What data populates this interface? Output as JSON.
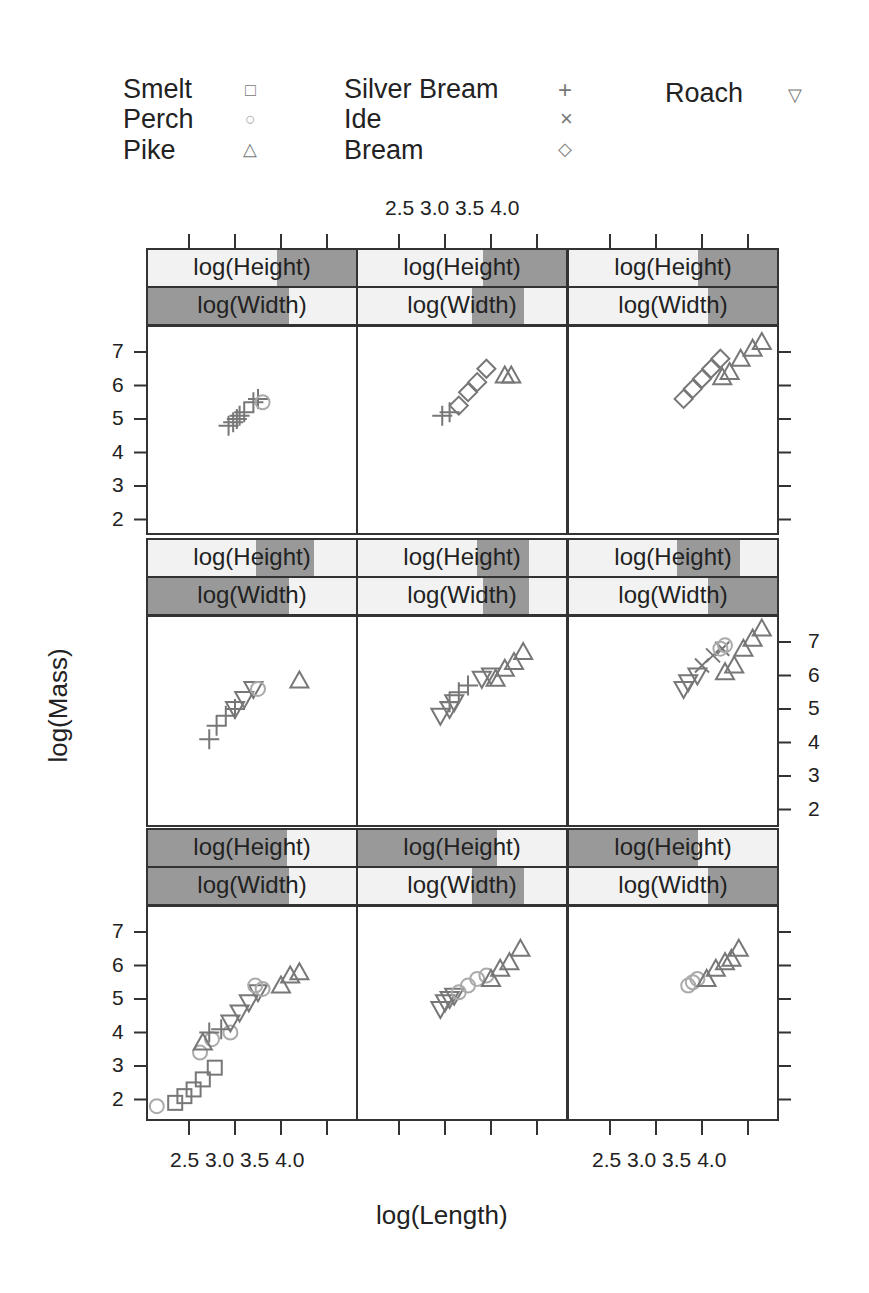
{
  "legend": {
    "items": [
      {
        "label": "Smelt",
        "symbol": "□",
        "shape": "square"
      },
      {
        "label": "Perch",
        "symbol": "○",
        "shape": "circle"
      },
      {
        "label": "Pike",
        "symbol": "△",
        "shape": "triangle"
      },
      {
        "label": "Silver Bream",
        "symbol": "+",
        "shape": "plus"
      },
      {
        "label": "Ide",
        "symbol": "×",
        "shape": "cross"
      },
      {
        "label": "Bream",
        "symbol": "◇",
        "shape": "diamond"
      },
      {
        "label": "Roach",
        "symbol": "▽",
        "shape": "triangle-down"
      }
    ]
  },
  "strips": {
    "height_label": "log(Height)",
    "width_label": "log(Width)"
  },
  "axes": {
    "x_ticks": [
      "2.5",
      "3.0",
      "3.5",
      "4.0"
    ],
    "y_ticks": [
      "2",
      "3",
      "4",
      "5",
      "6",
      "7"
    ],
    "xlabel": "log(Length)",
    "ylabel": "log(Mass)"
  },
  "colors": {
    "strip_shade": "#999999",
    "strip_bg": "#f2f2f2",
    "marker_dark": "#777777",
    "marker_light": "#aaaaaa",
    "frame": "#333333"
  },
  "chart_data": {
    "type": "scatter",
    "title": "",
    "xlabel": "log(Length)",
    "ylabel": "log(Mass)",
    "xlim": [
      2.0,
      4.3
    ],
    "ylim": [
      1.5,
      7.6
    ],
    "x_tick_labels": [
      "2.5",
      "3.0",
      "3.5",
      "4.0"
    ],
    "y_tick_labels": [
      "2",
      "3",
      "4",
      "5",
      "6",
      "7"
    ],
    "grid": false,
    "legend_position": "top",
    "layout": "3x3 coplot conditioned on log(Height) (upper strip) and log(Width) (lower strip)",
    "series_names": [
      "Smelt",
      "Perch",
      "Pike",
      "Silver Bream",
      "Ide",
      "Bream",
      "Roach"
    ],
    "panels": [
      {
        "row": 1,
        "col": 1,
        "height_shade": [
          0.62,
          1.0
        ],
        "width_shade": [
          0.0,
          0.68
        ],
        "points": [
          {
            "series": "Silver Bream",
            "x": [
              2.93,
              2.98,
              3.02,
              3.05,
              3.1,
              3.2,
              3.25
            ],
            "y": [
              4.8,
              4.9,
              5.0,
              5.1,
              5.2,
              5.5,
              5.6
            ]
          },
          {
            "series": "Perch",
            "x": [
              3.3
            ],
            "y": [
              5.5
            ]
          }
        ]
      },
      {
        "row": 1,
        "col": 2,
        "height_shade": [
          0.6,
          1.0
        ],
        "width_shade": [
          0.55,
          0.8
        ],
        "points": [
          {
            "series": "Silver Bream",
            "x": [
              2.97,
              3.05
            ],
            "y": [
              5.1,
              5.2
            ]
          },
          {
            "series": "Bream",
            "x": [
              3.15,
              3.25,
              3.35,
              3.45
            ],
            "y": [
              5.4,
              5.8,
              6.1,
              6.5
            ]
          },
          {
            "series": "Pike",
            "x": [
              3.65,
              3.72
            ],
            "y": [
              6.3,
              6.3
            ]
          }
        ]
      },
      {
        "row": 1,
        "col": 3,
        "height_shade": [
          0.62,
          1.0
        ],
        "width_shade": [
          0.67,
          1.0
        ],
        "points": [
          {
            "series": "Bream",
            "x": [
              3.3,
              3.4,
              3.5,
              3.6,
              3.7
            ],
            "y": [
              5.6,
              5.9,
              6.2,
              6.5,
              6.8
            ]
          },
          {
            "series": "Pike",
            "x": [
              3.72,
              3.8,
              3.92,
              4.05,
              4.15
            ],
            "y": [
              6.25,
              6.4,
              6.8,
              7.1,
              7.3
            ]
          }
        ]
      },
      {
        "row": 2,
        "col": 1,
        "height_shade": [
          0.52,
          0.8
        ],
        "width_shade": [
          0.0,
          0.68
        ],
        "points": [
          {
            "series": "Silver Bream",
            "x": [
              2.72,
              2.8,
              2.9,
              3.0
            ],
            "y": [
              4.1,
              4.5,
              4.8,
              5.0
            ]
          },
          {
            "series": "Roach",
            "x": [
              3.0,
              3.1,
              3.2
            ],
            "y": [
              5.0,
              5.3,
              5.6
            ]
          },
          {
            "series": "Perch",
            "x": [
              3.25
            ],
            "y": [
              5.6
            ]
          },
          {
            "series": "Pike",
            "x": [
              3.7
            ],
            "y": [
              5.85
            ]
          }
        ]
      },
      {
        "row": 2,
        "col": 2,
        "height_shade": [
          0.57,
          0.82
        ],
        "width_shade": [
          0.6,
          0.82
        ],
        "points": [
          {
            "series": "Roach",
            "x": [
              2.95,
              3.05,
              3.1
            ],
            "y": [
              4.8,
              5.0,
              5.2
            ]
          },
          {
            "series": "Silver Bream",
            "x": [
              3.05,
              3.15,
              3.25
            ],
            "y": [
              5.2,
              5.5,
              5.7
            ]
          },
          {
            "series": "Roach",
            "x": [
              3.4,
              3.5
            ],
            "y": [
              5.9,
              6.0
            ]
          },
          {
            "series": "Pike",
            "x": [
              3.55,
              3.65,
              3.75,
              3.85
            ],
            "y": [
              5.9,
              6.2,
              6.4,
              6.7
            ]
          }
        ]
      },
      {
        "row": 2,
        "col": 3,
        "height_shade": [
          0.52,
          0.82
        ],
        "width_shade": [
          0.67,
          1.0
        ],
        "points": [
          {
            "series": "Roach",
            "x": [
              3.3,
              3.35,
              3.45
            ],
            "y": [
              5.6,
              5.8,
              6.0
            ]
          },
          {
            "series": "Ide",
            "x": [
              3.5,
              3.62,
              3.72
            ],
            "y": [
              6.3,
              6.6,
              6.8
            ]
          },
          {
            "series": "Perch",
            "x": [
              3.7,
              3.75
            ],
            "y": [
              6.8,
              6.9
            ]
          },
          {
            "series": "Pike",
            "x": [
              3.75,
              3.85,
              3.95,
              4.05,
              4.15
            ],
            "y": [
              6.1,
              6.3,
              6.8,
              7.1,
              7.4
            ]
          }
        ]
      },
      {
        "row": 3,
        "col": 1,
        "height_shade": [
          0.0,
          0.67
        ],
        "width_shade": [
          0.0,
          0.68
        ],
        "points": [
          {
            "series": "Perch",
            "x": [
              2.15
            ],
            "y": [
              1.8
            ]
          },
          {
            "series": "Smelt",
            "x": [
              2.35,
              2.45,
              2.55,
              2.65,
              2.78
            ],
            "y": [
              1.9,
              2.1,
              2.3,
              2.6,
              2.95
            ]
          },
          {
            "series": "Perch",
            "x": [
              2.62,
              2.75,
              2.95
            ],
            "y": [
              3.4,
              3.8,
              4.0
            ]
          },
          {
            "series": "Pike",
            "x": [
              2.65
            ],
            "y": [
              3.7
            ]
          },
          {
            "series": "Silver Bream",
            "x": [
              2.72,
              2.85
            ],
            "y": [
              4.0,
              4.1
            ]
          },
          {
            "series": "Roach",
            "x": [
              2.95,
              3.05,
              3.15,
              3.25
            ],
            "y": [
              4.3,
              4.6,
              4.9,
              5.2
            ]
          },
          {
            "series": "Perch",
            "x": [
              3.22,
              3.3
            ],
            "y": [
              5.4,
              5.3
            ]
          },
          {
            "series": "Pike",
            "x": [
              3.5,
              3.6,
              3.7
            ],
            "y": [
              5.4,
              5.7,
              5.8
            ]
          }
        ]
      },
      {
        "row": 3,
        "col": 2,
        "height_shade": [
          0.0,
          0.67
        ],
        "width_shade": [
          0.55,
          0.8
        ],
        "points": [
          {
            "series": "Roach",
            "x": [
              2.95,
              3.0,
              3.05,
              3.1
            ],
            "y": [
              4.7,
              4.9,
              5.0,
              5.1
            ]
          },
          {
            "series": "Perch",
            "x": [
              3.15,
              3.25,
              3.35,
              3.45
            ],
            "y": [
              5.2,
              5.4,
              5.6,
              5.7
            ]
          },
          {
            "series": "Pike",
            "x": [
              3.5,
              3.6,
              3.7,
              3.82
            ],
            "y": [
              5.6,
              5.9,
              6.1,
              6.5
            ]
          }
        ]
      },
      {
        "row": 3,
        "col": 3,
        "height_shade": [
          0.0,
          0.62
        ],
        "width_shade": [
          0.67,
          1.0
        ],
        "points": [
          {
            "series": "Perch",
            "x": [
              3.35,
              3.4,
              3.45
            ],
            "y": [
              5.4,
              5.5,
              5.6
            ]
          },
          {
            "series": "Pike",
            "x": [
              3.55,
              3.65,
              3.75,
              3.82,
              3.9
            ],
            "y": [
              5.6,
              5.9,
              6.1,
              6.2,
              6.5
            ]
          }
        ]
      }
    ]
  }
}
